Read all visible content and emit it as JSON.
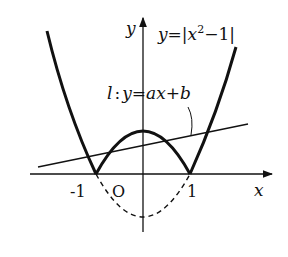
{
  "diagram": {
    "axes": {
      "x_label": "x",
      "y_label": "y",
      "origin_label": "O",
      "tick_labels": [
        "-1",
        "1"
      ]
    },
    "curve": {
      "label_prefix": "y=|x",
      "label_sup": "2",
      "label_suffix": "−1|",
      "equation": "y=|x^2-1|"
    },
    "line": {
      "label": "l : y=ax+b",
      "label_l": "l",
      "label_colon": ":",
      "label_rest": "y=ax+b"
    },
    "colors": {
      "stroke": "#111111",
      "background": "#ffffff"
    }
  }
}
